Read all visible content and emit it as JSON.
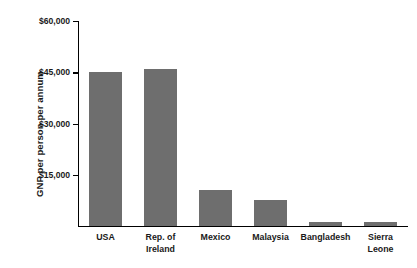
{
  "chart_data": {
    "type": "bar",
    "title": "",
    "xlabel": "",
    "ylabel": "GNP per person per annum",
    "categories": [
      "USA",
      "Rep. of Ireland",
      "Mexico",
      "Malaysia",
      "Bangladesh",
      "Sierra Leone"
    ],
    "category_lines": [
      [
        "USA"
      ],
      [
        "Rep. of",
        "Ireland"
      ],
      [
        "Mexico"
      ],
      [
        "Malaysia"
      ],
      [
        "Bangladesh"
      ],
      [
        "Sierra",
        "Leone"
      ]
    ],
    "values": [
      45000,
      46000,
      10400,
      7700,
      1200,
      1100
    ],
    "ylim": [
      0,
      60000
    ],
    "yticks": [
      15000,
      30000,
      45000,
      60000
    ],
    "ytick_labels": [
      "$15,000",
      "$30,000",
      "$45,000",
      "$60,000"
    ],
    "grid": false,
    "legend": false,
    "bar_color": "#6e6e6e",
    "axis_color": "#000000",
    "text_color": "#1a1a1a"
  }
}
